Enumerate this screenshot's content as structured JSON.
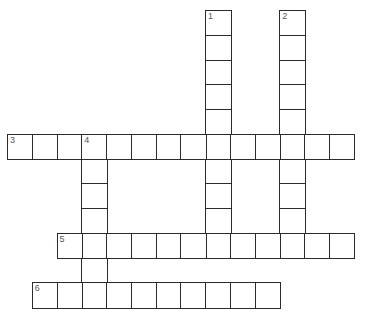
{
  "puzzle": {
    "type": "crossword",
    "grid": {
      "origin_x": 8,
      "origin_y": 11,
      "cell_size": 24.75,
      "columns": 14,
      "rows": 12
    },
    "entries": [
      {
        "number": "1",
        "direction": "down",
        "row": 0,
        "col": 8,
        "length": 10
      },
      {
        "number": "2",
        "direction": "down",
        "row": 0,
        "col": 11,
        "length": 10
      },
      {
        "number": "3",
        "direction": "across",
        "row": 5,
        "col": 0,
        "length": 14
      },
      {
        "number": "4",
        "direction": "down",
        "row": 5,
        "col": 3,
        "length": 7
      },
      {
        "number": "5",
        "direction": "across",
        "row": 9,
        "col": 2,
        "length": 12
      },
      {
        "number": "6",
        "direction": "across",
        "row": 11,
        "col": 1,
        "length": 10
      }
    ],
    "colors": {
      "border": "#2b2b2b",
      "number": "#555555",
      "background": "#ffffff"
    }
  }
}
